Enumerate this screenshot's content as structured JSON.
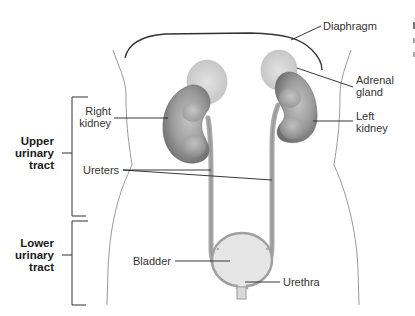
{
  "diagram": {
    "colors": {
      "kidney": "#8c8c8c",
      "kidney_light": "#bdbdbd",
      "adrenal": "#d6d6d6",
      "ureter": "#a8a8a8",
      "bladder_fill": "#e6e6e6",
      "bladder_edge": "#a0a0a0",
      "outline": "#888888",
      "leader": "#222222"
    },
    "labels": {
      "diaphragm": "Diaphragm",
      "adrenal_gland": [
        "Adrenal",
        "gland"
      ],
      "right_kidney": [
        "Right",
        "kidney"
      ],
      "left_kidney": [
        "Left",
        "kidney"
      ],
      "ureters": "Ureters",
      "bladder": "Bladder",
      "urethra": "Urethra"
    },
    "groups": {
      "upper": [
        "Upper",
        "urinary",
        "tract"
      ],
      "lower": [
        "Lower",
        "urinary",
        "tract"
      ]
    }
  }
}
